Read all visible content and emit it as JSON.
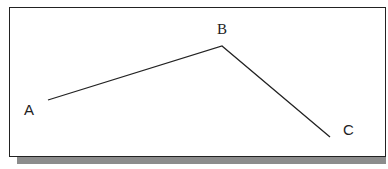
{
  "diagram": {
    "points": [
      {
        "label": "A",
        "x": 48,
        "y": 100
      },
      {
        "label": "B",
        "x": 222,
        "y": 46
      },
      {
        "label": "C",
        "x": 330,
        "y": 137
      }
    ],
    "labels": {
      "a": "A",
      "b": "B",
      "c": "C"
    },
    "colors": {
      "line": "#222222",
      "shadow": "#8c8c8c",
      "border": "#222222"
    }
  }
}
